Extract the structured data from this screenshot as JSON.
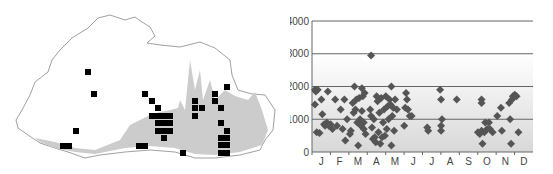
{
  "map": {
    "outline_color": "#888888",
    "range_fill": "#cccccc",
    "marker_color": "#000000",
    "squares": [
      [
        88,
        72
      ],
      [
        94,
        94
      ],
      [
        76,
        131
      ],
      [
        63,
        146
      ],
      [
        69,
        146
      ],
      [
        145,
        94
      ],
      [
        152,
        101
      ],
      [
        158,
        108
      ],
      [
        152,
        116
      ],
      [
        158,
        116
      ],
      [
        164,
        116
      ],
      [
        170,
        116
      ],
      [
        158,
        123
      ],
      [
        164,
        123
      ],
      [
        170,
        123
      ],
      [
        158,
        131
      ],
      [
        164,
        131
      ],
      [
        170,
        131
      ],
      [
        164,
        138
      ],
      [
        139,
        146
      ],
      [
        145,
        146
      ],
      [
        183,
        153
      ],
      [
        195,
        101
      ],
      [
        195,
        108
      ],
      [
        202,
        108
      ],
      [
        195,
        116
      ],
      [
        215,
        94
      ],
      [
        215,
        101
      ],
      [
        221,
        108
      ],
      [
        227,
        87
      ],
      [
        221,
        123
      ],
      [
        227,
        131
      ],
      [
        221,
        138
      ],
      [
        227,
        138
      ],
      [
        221,
        145
      ],
      [
        227,
        145
      ],
      [
        221,
        153
      ],
      [
        227,
        153
      ]
    ]
  },
  "chart_data": {
    "type": "scatter",
    "title": "",
    "xlabel": "",
    "ylabel": "",
    "ylim": [
      0,
      4000
    ],
    "yticks": [
      "0",
      "1000",
      "2000",
      "3000",
      "4000"
    ],
    "categories": [
      "J",
      "F",
      "M",
      "A",
      "M",
      "J",
      "J",
      "A",
      "S",
      "O",
      "N",
      "D"
    ],
    "grid": true,
    "marker": "diamond",
    "marker_color": "#555555",
    "points": [
      [
        0.05,
        1900
      ],
      [
        0.1,
        1850
      ],
      [
        0.2,
        1900
      ],
      [
        0.05,
        1450
      ],
      [
        0.15,
        600
      ],
      [
        0.3,
        580
      ],
      [
        0.4,
        1600
      ],
      [
        0.45,
        1150
      ],
      [
        0.55,
        850
      ],
      [
        0.6,
        800
      ],
      [
        0.7,
        900
      ],
      [
        0.75,
        1850
      ],
      [
        0.8,
        800
      ],
      [
        0.9,
        850
      ],
      [
        1.0,
        700
      ],
      [
        1.15,
        1600
      ],
      [
        1.25,
        800
      ],
      [
        1.45,
        1300
      ],
      [
        1.55,
        700
      ],
      [
        1.65,
        1600
      ],
      [
        1.7,
        350
      ],
      [
        1.8,
        1000
      ],
      [
        1.95,
        550
      ],
      [
        2.0,
        650
      ],
      [
        2.1,
        1500
      ],
      [
        2.15,
        1200
      ],
      [
        2.2,
        2000
      ],
      [
        2.25,
        1300
      ],
      [
        2.3,
        1600
      ],
      [
        2.35,
        900
      ],
      [
        2.4,
        200
      ],
      [
        2.45,
        1650
      ],
      [
        2.5,
        1000
      ],
      [
        2.55,
        800
      ],
      [
        2.6,
        1950
      ],
      [
        2.6,
        1250
      ],
      [
        2.65,
        1700
      ],
      [
        2.7,
        700
      ],
      [
        2.7,
        900
      ],
      [
        2.75,
        1800
      ],
      [
        2.8,
        550
      ],
      [
        3.1,
        2950
      ],
      [
        3.05,
        1300
      ],
      [
        3.1,
        1100
      ],
      [
        3.15,
        750
      ],
      [
        3.2,
        400
      ],
      [
        3.25,
        1000
      ],
      [
        3.3,
        450
      ],
      [
        3.35,
        300
      ],
      [
        3.4,
        1700
      ],
      [
        3.45,
        1550
      ],
      [
        3.5,
        600
      ],
      [
        3.55,
        1200
      ],
      [
        3.6,
        250
      ],
      [
        3.65,
        1650
      ],
      [
        3.7,
        450
      ],
      [
        3.75,
        900
      ],
      [
        3.8,
        1300
      ],
      [
        3.85,
        500
      ],
      [
        3.9,
        1700
      ],
      [
        3.95,
        700
      ],
      [
        4.0,
        1400
      ],
      [
        4.05,
        1000
      ],
      [
        4.1,
        1600
      ],
      [
        4.15,
        1450
      ],
      [
        4.2,
        2000
      ],
      [
        4.2,
        200
      ],
      [
        4.25,
        1100
      ],
      [
        4.3,
        1350
      ],
      [
        4.35,
        650
      ],
      [
        4.4,
        1600
      ],
      [
        4.5,
        1300
      ],
      [
        4.9,
        800
      ],
      [
        4.95,
        1350
      ],
      [
        5.0,
        1800
      ],
      [
        5.05,
        1600
      ],
      [
        5.1,
        1300
      ],
      [
        5.2,
        1100
      ],
      [
        5.3,
        1100
      ],
      [
        6.15,
        750
      ],
      [
        6.2,
        650
      ],
      [
        6.85,
        1900
      ],
      [
        6.9,
        1600
      ],
      [
        6.9,
        800
      ],
      [
        6.9,
        650
      ],
      [
        6.95,
        1000
      ],
      [
        7.75,
        1600
      ],
      [
        8.9,
        600
      ],
      [
        9.0,
        550
      ],
      [
        9.1,
        1500
      ],
      [
        9.1,
        1600
      ],
      [
        9.1,
        650
      ],
      [
        9.15,
        250
      ],
      [
        9.25,
        600
      ],
      [
        9.3,
        900
      ],
      [
        9.4,
        700
      ],
      [
        9.5,
        900
      ],
      [
        9.55,
        700
      ],
      [
        9.7,
        600
      ],
      [
        9.95,
        1100
      ],
      [
        10.15,
        1350
      ],
      [
        10.2,
        650
      ],
      [
        10.6,
        1500
      ],
      [
        10.65,
        1000
      ],
      [
        10.7,
        250
      ],
      [
        10.75,
        1600
      ],
      [
        10.8,
        1700
      ],
      [
        10.9,
        1750
      ],
      [
        11.0,
        1700
      ],
      [
        11.1,
        600
      ]
    ]
  }
}
